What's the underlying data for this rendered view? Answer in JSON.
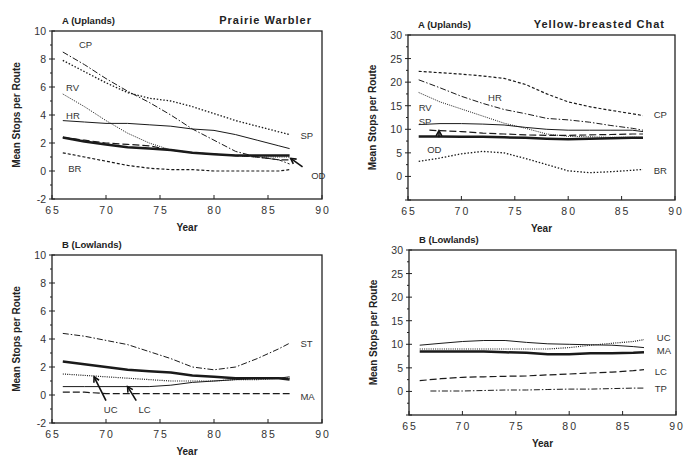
{
  "chart_data": [
    {
      "id": "pw_up",
      "type": "line",
      "panel_label": "A (Uplands)",
      "title": "Prairie    Warbler",
      "xlabel": "Year",
      "ylabel": "Mean  Stops  per  Route",
      "xlim": [
        65,
        90
      ],
      "ylim": [
        -2,
        10
      ],
      "xticks": [
        65,
        70,
        75,
        80,
        85,
        90
      ],
      "yticks": [
        -2,
        0,
        2,
        4,
        6,
        8,
        10
      ],
      "box": {
        "x0": 52,
        "x1": 322,
        "y0": 31,
        "y1": 199
      },
      "series": [
        {
          "name": "CP",
          "style": "dashdot",
          "width": 1,
          "x": [
            66,
            68,
            70,
            72,
            74,
            76,
            78,
            80,
            82,
            84,
            86,
            87
          ],
          "y": [
            8.5,
            7.6,
            6.6,
            5.7,
            4.9,
            4.0,
            3.0,
            2.2,
            1.4,
            1.0,
            0.8,
            0.5
          ]
        },
        {
          "name": "SP",
          "style": "dotted",
          "width": 1.3,
          "x": [
            66,
            68,
            70,
            72,
            74,
            76,
            78,
            80,
            82,
            84,
            86,
            87
          ],
          "y": [
            7.9,
            7.1,
            6.3,
            5.6,
            5.2,
            5.0,
            4.6,
            4.1,
            3.6,
            3.2,
            2.8,
            2.6
          ]
        },
        {
          "name": "RV",
          "style": "dotted-fine",
          "width": 1,
          "x": [
            66,
            68,
            70,
            72,
            74,
            76,
            78,
            80,
            82,
            84,
            86,
            87
          ],
          "y": [
            5.5,
            4.6,
            3.6,
            2.7,
            2.0,
            1.5,
            1.3,
            1.2,
            1.1,
            1.0,
            1.0,
            1.0
          ]
        },
        {
          "name": "HR",
          "style": "solid",
          "width": 1,
          "x": [
            66,
            68,
            70,
            72,
            74,
            76,
            78,
            80,
            82,
            84,
            86,
            87
          ],
          "y": [
            3.6,
            3.5,
            3.4,
            3.4,
            3.3,
            3.2,
            3.0,
            2.9,
            2.6,
            2.2,
            1.8,
            1.6
          ]
        },
        {
          "name": "OD",
          "style": "dashed",
          "width": 1.2,
          "x": [
            66,
            68,
            70,
            72,
            74,
            76,
            78,
            80,
            82,
            84,
            86,
            87
          ],
          "y": [
            2.4,
            2.2,
            2.0,
            1.9,
            1.8,
            1.5,
            1.3,
            1.2,
            1.1,
            1.0,
            0.8,
            0.8
          ]
        },
        {
          "name": "Mean",
          "style": "solid",
          "width": 2.5,
          "x": [
            66,
            68,
            70,
            72,
            74,
            76,
            78,
            80,
            82,
            84,
            86,
            87
          ],
          "y": [
            2.4,
            2.1,
            1.9,
            1.7,
            1.6,
            1.5,
            1.3,
            1.2,
            1.1,
            1.1,
            1.1,
            1.1
          ]
        },
        {
          "name": "BR",
          "style": "dashed-fine",
          "width": 1.2,
          "x": [
            66,
            68,
            70,
            72,
            74,
            76,
            78,
            80,
            82,
            84,
            86,
            87
          ],
          "y": [
            1.3,
            1.0,
            0.7,
            0.4,
            0.2,
            0.1,
            0.1,
            0.0,
            0.0,
            0.0,
            0.0,
            0.1
          ]
        }
      ],
      "labels": [
        {
          "text": "CP",
          "x": 67.5,
          "y": 9.1
        },
        {
          "text": "RV",
          "x": 66.3,
          "y": 6.0
        },
        {
          "text": "HR",
          "x": 66.3,
          "y": 4.0
        },
        {
          "text": "SP",
          "x": 88.0,
          "y": 2.6
        },
        {
          "text": "BR",
          "x": 66.5,
          "y": 0.2
        },
        {
          "text": "OD",
          "x": 89.0,
          "y": -0.3
        }
      ],
      "arrows": [
        {
          "from": [
            88.2,
            0.3
          ],
          "to": [
            87.1,
            0.9
          ]
        }
      ]
    },
    {
      "id": "ybc_up",
      "type": "line",
      "panel_label": "A (Uplands)",
      "title": "Yellow-breasted   Chat",
      "xlabel": "Year",
      "ylabel": "Mean  Stops  per  Route",
      "xlim": [
        65,
        90
      ],
      "ylim": [
        -5,
        30
      ],
      "xticks": [
        65,
        70,
        75,
        80,
        85,
        90
      ],
      "yticks": [
        0,
        5,
        10,
        15,
        20,
        25,
        30
      ],
      "ytick_min_drawn": -5,
      "box": {
        "x0": 408,
        "x1": 675,
        "y0": 35,
        "y1": 200
      },
      "series": [
        {
          "name": "CP",
          "style": "dashed-fine",
          "width": 1.2,
          "x": [
            66,
            68,
            70,
            72,
            74,
            76,
            78,
            80,
            82,
            84,
            86,
            87
          ],
          "y": [
            22.3,
            22.0,
            21.7,
            21.3,
            20.8,
            19.5,
            17.5,
            15.8,
            14.8,
            14.0,
            13.3,
            12.9
          ]
        },
        {
          "name": "HR",
          "style": "dashdot",
          "width": 1,
          "x": [
            66,
            68,
            70,
            72,
            74,
            76,
            78,
            80,
            82,
            84,
            86,
            87
          ],
          "y": [
            20.5,
            18.8,
            17.0,
            15.5,
            14.2,
            13.3,
            12.3,
            12.0,
            11.5,
            10.8,
            10.2,
            9.8
          ]
        },
        {
          "name": "RV",
          "style": "dotted-fine",
          "width": 1,
          "x": [
            66,
            68,
            70,
            72,
            74,
            76,
            78,
            80,
            82,
            84,
            86,
            87
          ],
          "y": [
            17.8,
            15.8,
            14.3,
            12.8,
            11.3,
            10.2,
            9.0,
            8.5,
            8.4,
            8.3,
            8.3,
            8.3
          ]
        },
        {
          "name": "SP",
          "style": "solid",
          "width": 1,
          "x": [
            66,
            68,
            70,
            72,
            74,
            76,
            78,
            80,
            82,
            84,
            86,
            87
          ],
          "y": [
            11.0,
            11.2,
            11.2,
            11.1,
            10.9,
            10.4,
            10.0,
            9.8,
            9.8,
            9.8,
            9.8,
            9.5
          ]
        },
        {
          "name": "OD",
          "style": "dashed",
          "width": 1.2,
          "x": [
            67,
            68,
            70,
            72,
            74,
            76,
            78,
            80,
            82,
            84,
            86,
            87
          ],
          "y": [
            9.8,
            9.7,
            9.5,
            9.2,
            9.0,
            8.8,
            8.7,
            8.7,
            8.8,
            8.9,
            9.0,
            9.0
          ]
        },
        {
          "name": "Mean",
          "style": "solid",
          "width": 2.5,
          "x": [
            66,
            68,
            70,
            72,
            74,
            76,
            78,
            80,
            82,
            84,
            86,
            87
          ],
          "y": [
            8.5,
            8.5,
            8.4,
            8.4,
            8.3,
            8.2,
            8.0,
            7.9,
            8.0,
            8.1,
            8.2,
            8.2
          ]
        },
        {
          "name": "BR",
          "style": "dotted",
          "width": 1.3,
          "x": [
            66,
            68,
            70,
            72,
            74,
            76,
            78,
            80,
            82,
            84,
            86,
            87
          ],
          "y": [
            3.2,
            3.9,
            4.8,
            5.3,
            5.0,
            3.8,
            2.5,
            1.2,
            0.8,
            1.0,
            1.3,
            1.5
          ]
        }
      ],
      "labels": [
        {
          "text": "HR",
          "x": 72.5,
          "y": 16.8
        },
        {
          "text": "RV",
          "x": 66.0,
          "y": 14.7
        },
        {
          "text": "SP",
          "x": 66.0,
          "y": 11.8
        },
        {
          "text": "OD",
          "x": 66.8,
          "y": 5.8
        },
        {
          "text": "CP",
          "x": 88.0,
          "y": 13.2
        },
        {
          "text": "BR",
          "x": 88.0,
          "y": 1.3
        }
      ],
      "arrows": [
        {
          "from": [
            67.9,
            8.3
          ],
          "to": [
            67.9,
            9.7
          ]
        }
      ]
    },
    {
      "id": "pw_low",
      "type": "line",
      "panel_label": "B (Lowlands)",
      "title": "",
      "xlabel": "Year",
      "ylabel": "Mean  Stops  per  Route",
      "xlim": [
        65,
        90
      ],
      "ylim": [
        -2,
        10
      ],
      "xticks": [
        65,
        70,
        75,
        80,
        85,
        90
      ],
      "yticks": [
        -2,
        0,
        2,
        4,
        6,
        8,
        10
      ],
      "box": {
        "x0": 52,
        "x1": 322,
        "y0": 255,
        "y1": 423
      },
      "series": [
        {
          "name": "ST",
          "style": "dashdot",
          "width": 1,
          "x": [
            66,
            68,
            70,
            72,
            74,
            76,
            78,
            80,
            82,
            84,
            86,
            87
          ],
          "y": [
            4.4,
            4.2,
            3.9,
            3.6,
            3.1,
            2.6,
            2.0,
            1.8,
            2.0,
            2.6,
            3.3,
            3.7
          ]
        },
        {
          "name": "Mean",
          "style": "solid",
          "width": 2.5,
          "x": [
            66,
            68,
            70,
            72,
            74,
            76,
            78,
            80,
            82,
            84,
            86,
            87
          ],
          "y": [
            2.4,
            2.2,
            2.0,
            1.8,
            1.7,
            1.6,
            1.4,
            1.3,
            1.2,
            1.2,
            1.2,
            1.1
          ]
        },
        {
          "name": "UC",
          "style": "dotted-fine",
          "width": 1.2,
          "x": [
            66,
            68,
            70,
            72,
            74,
            76,
            78,
            80,
            82,
            84,
            86,
            87
          ],
          "y": [
            1.5,
            1.4,
            1.3,
            1.2,
            1.1,
            1.0,
            1.0,
            1.0,
            1.1,
            1.1,
            1.2,
            1.2
          ]
        },
        {
          "name": "LC",
          "style": "solid",
          "width": 1,
          "x": [
            66,
            68,
            70,
            72,
            74,
            76,
            78,
            80,
            82,
            84,
            86,
            87
          ],
          "y": [
            0.6,
            0.6,
            0.6,
            0.6,
            0.6,
            0.7,
            0.9,
            1.0,
            1.1,
            1.2,
            1.2,
            1.3
          ]
        },
        {
          "name": "MA",
          "style": "dashed",
          "width": 1.2,
          "x": [
            66,
            68,
            70,
            72,
            74,
            76,
            78,
            80,
            82,
            84,
            86,
            87
          ],
          "y": [
            0.2,
            0.2,
            0.1,
            0.1,
            0.1,
            0.1,
            0.1,
            0.1,
            0.1,
            0.1,
            0.1,
            0.1
          ]
        }
      ],
      "labels": [
        {
          "text": "ST",
          "x": 88.0,
          "y": 3.7
        },
        {
          "text": "MA",
          "x": 88.0,
          "y": -0.1
        },
        {
          "text": "UC",
          "x": 69.8,
          "y": -1.0
        },
        {
          "text": "LC",
          "x": 73.0,
          "y": -1.0
        }
      ],
      "arrows": [
        {
          "from": [
            70.0,
            -0.4
          ],
          "to": [
            68.9,
            1.3
          ]
        },
        {
          "from": [
            72.8,
            -0.4
          ],
          "to": [
            72.0,
            0.6
          ]
        }
      ]
    },
    {
      "id": "ybc_low",
      "type": "line",
      "panel_label": "B (Lowlands)",
      "title": "",
      "xlabel": "Year",
      "ylabel": "Mean  Stops  per  Route",
      "xlim": [
        65,
        90
      ],
      "ylim": [
        -5,
        30
      ],
      "xticks": [
        65,
        70,
        75,
        80,
        85,
        90
      ],
      "yticks": [
        0,
        5,
        10,
        15,
        20,
        25,
        30
      ],
      "ytick_min_drawn": -5,
      "box": {
        "x0": 409,
        "x1": 676,
        "y0": 250,
        "y1": 415
      },
      "series": [
        {
          "name": "MA",
          "style": "solid",
          "width": 1,
          "x": [
            66,
            68,
            70,
            72,
            74,
            76,
            78,
            80,
            82,
            84,
            86,
            87
          ],
          "y": [
            9.8,
            10.2,
            10.6,
            10.8,
            10.8,
            10.4,
            10.1,
            10.0,
            9.9,
            9.8,
            9.5,
            9.3
          ]
        },
        {
          "name": "UC",
          "style": "dotted-fine",
          "width": 1.2,
          "x": [
            66,
            68,
            70,
            72,
            74,
            76,
            78,
            80,
            82,
            84,
            86,
            87
          ],
          "y": [
            9.0,
            9.0,
            9.0,
            9.0,
            9.0,
            9.0,
            9.0,
            9.3,
            9.8,
            10.2,
            10.6,
            11.0
          ]
        },
        {
          "name": "Mean",
          "style": "solid",
          "width": 2.5,
          "x": [
            66,
            68,
            70,
            72,
            74,
            76,
            78,
            80,
            82,
            84,
            86,
            87
          ],
          "y": [
            8.5,
            8.5,
            8.5,
            8.5,
            8.3,
            8.2,
            7.9,
            7.9,
            8.1,
            8.1,
            8.2,
            8.3
          ]
        },
        {
          "name": "LC",
          "style": "dashed",
          "width": 1.2,
          "x": [
            66,
            68,
            70,
            72,
            74,
            76,
            78,
            80,
            82,
            84,
            86,
            87
          ],
          "y": [
            2.3,
            2.7,
            3.0,
            3.1,
            3.2,
            3.3,
            3.5,
            3.7,
            3.9,
            4.1,
            4.4,
            4.6
          ]
        },
        {
          "name": "TP",
          "style": "dashdot",
          "width": 1,
          "x": [
            67,
            68,
            70,
            72,
            74,
            76,
            78,
            80,
            82,
            84,
            86,
            87
          ],
          "y": [
            0.1,
            0.1,
            0.1,
            0.2,
            0.3,
            0.3,
            0.4,
            0.5,
            0.5,
            0.6,
            0.7,
            0.7
          ]
        }
      ],
      "labels": [
        {
          "text": "UC",
          "x": 88.2,
          "y": 11.5
        },
        {
          "text": "MA",
          "x": 88.2,
          "y": 8.7
        },
        {
          "text": "LC",
          "x": 88.0,
          "y": 4.3
        },
        {
          "text": "TP",
          "x": 88.0,
          "y": 0.8
        }
      ],
      "arrows": []
    }
  ]
}
